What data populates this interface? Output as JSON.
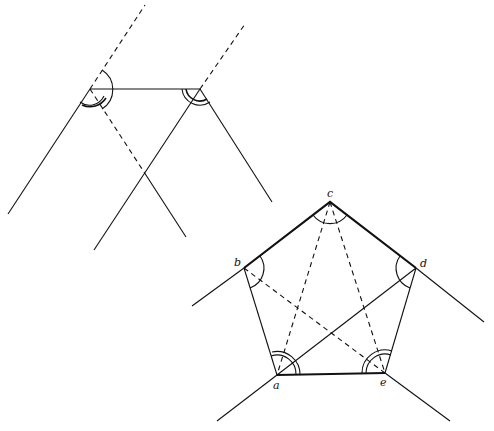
{
  "figure": {
    "pentagon_labels": {
      "a": "a",
      "b": "b",
      "c": "c",
      "d": "d",
      "e": "e"
    },
    "colors": {
      "stroke": "#111111",
      "background": "#ffffff"
    }
  }
}
